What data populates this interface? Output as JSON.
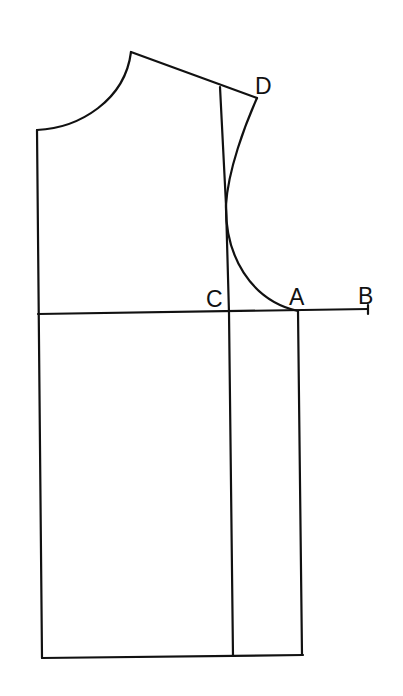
{
  "diagram": {
    "type": "bodice-pattern-draft",
    "stroke_color": "#111111",
    "background": "#ffffff",
    "labels": {
      "A": "A",
      "B": "B",
      "C": "C",
      "D": "D"
    },
    "points": {
      "neck_side": [
        131,
        52
      ],
      "neck_front": [
        37,
        130
      ],
      "shoulder_tip_D": [
        257,
        98
      ],
      "C": [
        229,
        313
      ],
      "A": [
        298,
        311
      ],
      "B": [
        368,
        310
      ]
    }
  }
}
